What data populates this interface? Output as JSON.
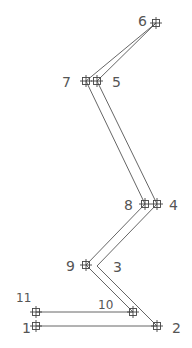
{
  "diagram": {
    "type": "node-frame-polyline",
    "line_color": "#555555",
    "nodes": [
      {
        "id": "1",
        "x": 36,
        "y": 326,
        "label": "1",
        "lx": 22,
        "ly": 333,
        "size": 14
      },
      {
        "id": "2",
        "x": 157,
        "y": 326,
        "label": "2",
        "lx": 172,
        "ly": 333,
        "size": 14
      },
      {
        "id": "3",
        "x": 97,
        "y": 266,
        "label": "3",
        "lx": 113,
        "ly": 272,
        "size": 14
      },
      {
        "id": "4",
        "x": 157,
        "y": 204,
        "label": "4",
        "lx": 169,
        "ly": 210,
        "size": 14
      },
      {
        "id": "5",
        "x": 97,
        "y": 81,
        "label": "5",
        "lx": 112,
        "ly": 87,
        "size": 14
      },
      {
        "id": "6",
        "x": 156,
        "y": 23,
        "label": "6",
        "lx": 138,
        "ly": 26,
        "size": 14
      },
      {
        "id": "7",
        "x": 86,
        "y": 81,
        "label": "7",
        "lx": 62,
        "ly": 87,
        "size": 14
      },
      {
        "id": "8",
        "x": 145,
        "y": 204,
        "label": "8",
        "lx": 124,
        "ly": 210,
        "size": 14
      },
      {
        "id": "9",
        "x": 86,
        "y": 265,
        "label": "9",
        "lx": 66,
        "ly": 271,
        "size": 14
      },
      {
        "id": "10",
        "x": 133,
        "y": 312,
        "label": "10",
        "lx": 98,
        "ly": 309,
        "size": 12
      },
      {
        "id": "11",
        "x": 36,
        "y": 312,
        "label": "11",
        "lx": 16,
        "ly": 302,
        "size": 12
      }
    ],
    "edges": [
      [
        "1",
        "2"
      ],
      [
        "2",
        "3"
      ],
      [
        "3",
        "4"
      ],
      [
        "4",
        "5"
      ],
      [
        "5",
        "6"
      ],
      [
        "6",
        "7"
      ],
      [
        "7",
        "8"
      ],
      [
        "8",
        "9"
      ],
      [
        "9",
        "10"
      ],
      [
        "10",
        "11"
      ]
    ],
    "markers_on": [
      "1",
      "2",
      "4",
      "5",
      "6",
      "7",
      "8",
      "9",
      "10",
      "11"
    ]
  }
}
